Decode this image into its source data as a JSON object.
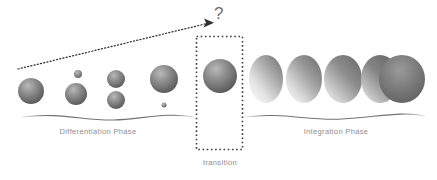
{
  "diagram": {
    "background_color": "#ffffff",
    "width": 437,
    "height": 180,
    "labels": {
      "differentiation_phase": "Differentiation Phase",
      "integration_phase": "Integration Phase",
      "transition": "transition",
      "question_mark": "?"
    },
    "colors": {
      "label_text": "#8e8e8e",
      "question_mark": "#6f6f6f",
      "baseline_stroke": "#6b6b6b",
      "dotted_box_stroke": "#3b3b3b",
      "arrow_stroke": "#2e2e2e",
      "sphere_dark": "#5e5e5e",
      "sphere_mid": "#8c8c8c",
      "sphere_light": "#c9c9c9",
      "oval_dark": "#6a6a6a",
      "oval_light": "#f2f2f2"
    },
    "annotations": {
      "arrow_description": "dotted arrow rising from lower-left to the question mark above the transition box",
      "arrow_start": "18,69",
      "arrow_end": "212,22"
    },
    "transition_box": {
      "x": 196,
      "y": 36,
      "width": 47,
      "height": 114,
      "style": "dotted"
    },
    "baselines": [
      {
        "name": "differentiation-baseline",
        "x1": 22,
        "x2": 194
      },
      {
        "name": "integration-baseline",
        "x1": 245,
        "x2": 425
      }
    ],
    "differentiation_objects": [
      {
        "name": "sphere-1",
        "cx": 31,
        "cy": 91,
        "r": 13,
        "kind": "sphere"
      },
      {
        "name": "sphere-2-small",
        "cx": 78,
        "cy": 74,
        "r": 4,
        "kind": "sphere"
      },
      {
        "name": "sphere-2-large",
        "cx": 76,
        "cy": 94,
        "r": 11,
        "kind": "sphere"
      },
      {
        "name": "sphere-3-top",
        "cx": 116,
        "cy": 79,
        "r": 9,
        "kind": "sphere"
      },
      {
        "name": "sphere-3-bottom",
        "cx": 116,
        "cy": 100,
        "r": 9,
        "kind": "sphere"
      },
      {
        "name": "sphere-4-large",
        "cx": 164,
        "cy": 79,
        "r": 14,
        "kind": "sphere"
      },
      {
        "name": "sphere-4-dot",
        "cx": 164,
        "cy": 105,
        "r": 2.5,
        "kind": "sphere"
      }
    ],
    "transition_object": {
      "name": "transition-sphere",
      "cx": 220,
      "cy": 76,
      "r": 17,
      "kind": "sphere"
    },
    "integration_objects": [
      {
        "name": "oval-1",
        "cx": 266,
        "cy": 79,
        "rx": 17,
        "ry": 24,
        "kind": "oval",
        "shade": 0.15
      },
      {
        "name": "oval-2",
        "cx": 304,
        "cy": 79,
        "rx": 18,
        "ry": 24,
        "kind": "oval",
        "shade": 0.3
      },
      {
        "name": "oval-3",
        "cx": 343,
        "cy": 79,
        "rx": 19,
        "ry": 24,
        "kind": "oval",
        "shade": 0.5
      },
      {
        "name": "oval-4",
        "cx": 384,
        "cy": 79,
        "rx": 21,
        "ry": 23,
        "kind": "oval",
        "shade": 0.75
      },
      {
        "name": "sphere-final",
        "cx": 400,
        "cy": 79,
        "rx": 23,
        "ry": 24,
        "kind": "sphere-large",
        "shade": 1
      }
    ]
  }
}
